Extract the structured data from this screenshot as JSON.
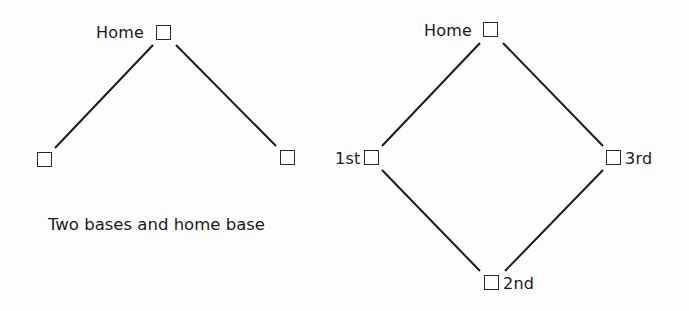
{
  "left_diagram": {
    "title": "Two bases and home base",
    "bases": [
      {
        "id": "home",
        "label": "Home"
      },
      {
        "id": "left",
        "label": ""
      },
      {
        "id": "right",
        "label": ""
      }
    ]
  },
  "right_diagram": {
    "bases": [
      {
        "id": "home",
        "label": "Home"
      },
      {
        "id": "first",
        "label": "1st"
      },
      {
        "id": "third",
        "label": "3rd"
      },
      {
        "id": "second",
        "label": "2nd"
      }
    ]
  },
  "colors": {
    "line": "#1a1a1a",
    "background": "#fdfdfd"
  }
}
